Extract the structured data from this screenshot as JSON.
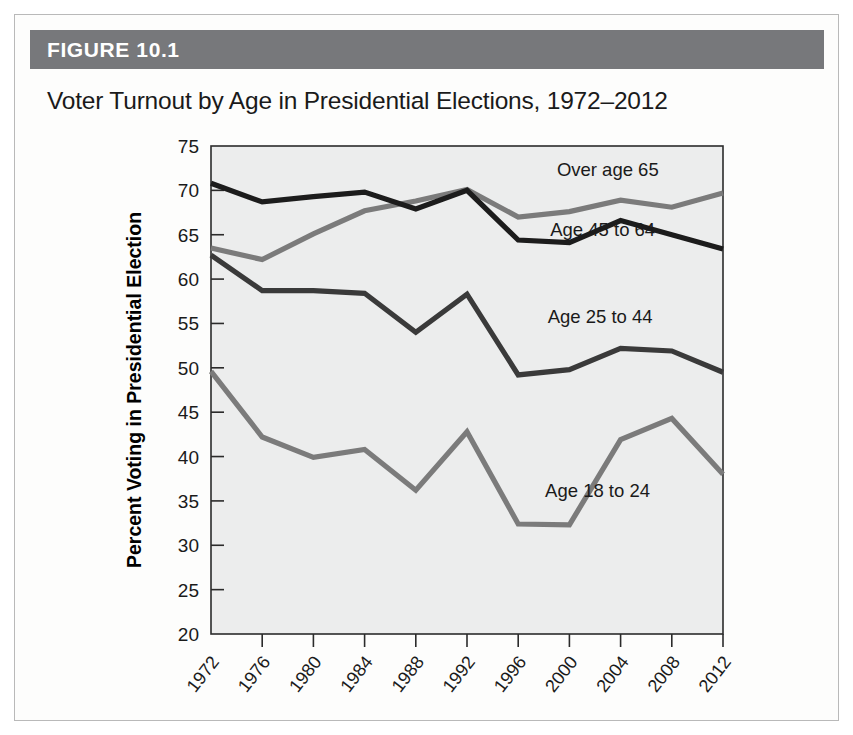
{
  "figure": {
    "band_label": "FIGURE 10.1",
    "title": "Voter Turnout by Age in Presidential Elections, 1972–2012",
    "band_color": "#77787b",
    "plot_background": "#eceded"
  },
  "chart_data": {
    "type": "line",
    "title": "Voter Turnout by Age in Presidential Elections, 1972–2012",
    "xlabel": "Year",
    "ylabel": "Percent Voting in Presidential Election",
    "x": [
      1972,
      1976,
      1980,
      1984,
      1988,
      1992,
      1996,
      2000,
      2004,
      2008,
      2012
    ],
    "xtick_labels": [
      "1972",
      "1976",
      "1980",
      "1984",
      "1988",
      "1992",
      "1996",
      "2000",
      "2004",
      "2008",
      "2012"
    ],
    "ytick_labels": [
      "20",
      "25",
      "30",
      "35",
      "40",
      "45",
      "50",
      "55",
      "60",
      "65",
      "70",
      "75"
    ],
    "yticks": [
      20,
      25,
      30,
      35,
      40,
      45,
      50,
      55,
      60,
      65,
      70,
      75
    ],
    "ylim": [
      20,
      75
    ],
    "grid": false,
    "legend_position": "inline-labels",
    "series": [
      {
        "name": "Over age 65",
        "label": "Over age 65",
        "color": "#7b7b7b",
        "values": [
          63.5,
          62.2,
          65.1,
          67.7,
          68.8,
          70.1,
          67.0,
          67.6,
          68.9,
          68.1,
          69.7
        ]
      },
      {
        "name": "Age 45 to 64",
        "label": "Age 45 to 64",
        "color": "#1c1c1c",
        "values": [
          70.8,
          68.7,
          69.3,
          69.8,
          67.9,
          70.0,
          64.4,
          64.1,
          66.6,
          65.0,
          63.4
        ]
      },
      {
        "name": "Age 25 to 44",
        "label": "Age 25 to 44",
        "color": "#3a3a3a",
        "values": [
          62.7,
          58.7,
          58.7,
          58.4,
          54.0,
          58.3,
          49.2,
          49.8,
          52.2,
          51.9,
          49.5
        ]
      },
      {
        "name": "Age 18 to 24",
        "label": "Age 18 to 24",
        "color": "#7b7b7b",
        "values": [
          49.6,
          42.2,
          39.9,
          40.8,
          36.2,
          42.8,
          32.4,
          32.3,
          41.9,
          44.3,
          38.0
        ]
      }
    ],
    "annotations": [
      {
        "text": "Over age 65",
        "x": 2003.0,
        "y": 71.6
      },
      {
        "text": "Age 45 to 64",
        "x": 2002.6,
        "y": 64.9
      },
      {
        "text": "Age 25 to 44",
        "x": 2002.4,
        "y": 55.0
      },
      {
        "text": "Age 18 to 24",
        "x": 2002.2,
        "y": 35.4
      }
    ]
  }
}
